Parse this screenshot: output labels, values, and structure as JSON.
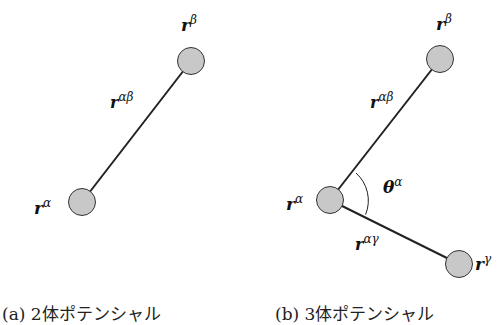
{
  "panel_a": {
    "caption": "(a) 2体ポテンシャル",
    "atoms": [
      {
        "id": "alpha",
        "label": "r",
        "sup": "α",
        "cx": 82,
        "cy": 202
      },
      {
        "id": "beta",
        "label": "r",
        "sup": "β",
        "cx": 191,
        "cy": 61
      }
    ],
    "bond_label": {
      "base": "r",
      "sup": "αβ"
    }
  },
  "panel_b": {
    "caption": "(b) 3体ポテンシャル",
    "atoms": [
      {
        "id": "alpha",
        "label": "r",
        "sup": "α",
        "cx": 330,
        "cy": 200
      },
      {
        "id": "beta",
        "label": "r",
        "sup": "β",
        "cx": 440,
        "cy": 59
      },
      {
        "id": "gamma",
        "label": "r",
        "sup": "γ",
        "cx": 459,
        "cy": 264
      }
    ],
    "bond_labels": [
      {
        "base": "r",
        "sup": "αβ"
      },
      {
        "base": "r",
        "sup": "αγ"
      }
    ],
    "angle_label": {
      "base": "θ",
      "sup": "α"
    }
  },
  "colors": {
    "atom_fill": "#c8c8c8",
    "stroke": "#222222"
  }
}
